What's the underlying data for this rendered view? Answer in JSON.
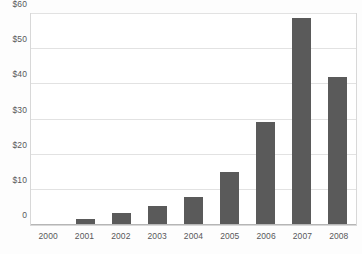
{
  "chart_data": {
    "type": "bar",
    "title": "",
    "subtitle": "",
    "xlabel": "",
    "ylabel": "",
    "categories": [
      "2000",
      "2001",
      "2002",
      "2003",
      "2004",
      "2005",
      "2006",
      "2007",
      "2008"
    ],
    "values": [
      0.3,
      1.7,
      3.5,
      5.5,
      8.0,
      15.2,
      29.2,
      59.0,
      42.0
    ],
    "series": [
      {
        "name": "",
        "values": [
          0.3,
          1.7,
          3.5,
          5.5,
          8.0,
          15.2,
          29.2,
          59.0,
          42.0
        ]
      }
    ],
    "ylim": [
      0,
      60
    ],
    "xlim_categories": 9,
    "yticks": [
      0,
      10,
      20,
      30,
      40,
      50,
      60
    ],
    "ytick_labels": [
      "0",
      "$10",
      "$20",
      "$30",
      "$40",
      "$50",
      "$60"
    ],
    "xtick_labels": [
      "2000",
      "2001",
      "2002",
      "2003",
      "2004",
      "2005",
      "2006",
      "2007",
      "2008"
    ],
    "grid": true,
    "grid_axis": "y",
    "legend": false,
    "legend_position": "none",
    "annotations": [],
    "colors": {
      "bar": "#5a5a5a",
      "gridline": "#e2e2e2",
      "plot_border": "#d8d8d8",
      "axis_line": "#b6b6b6",
      "tick_label": "#58585a",
      "plot_background": "#ffffff",
      "figure_background": "#fdfdfd"
    }
  }
}
